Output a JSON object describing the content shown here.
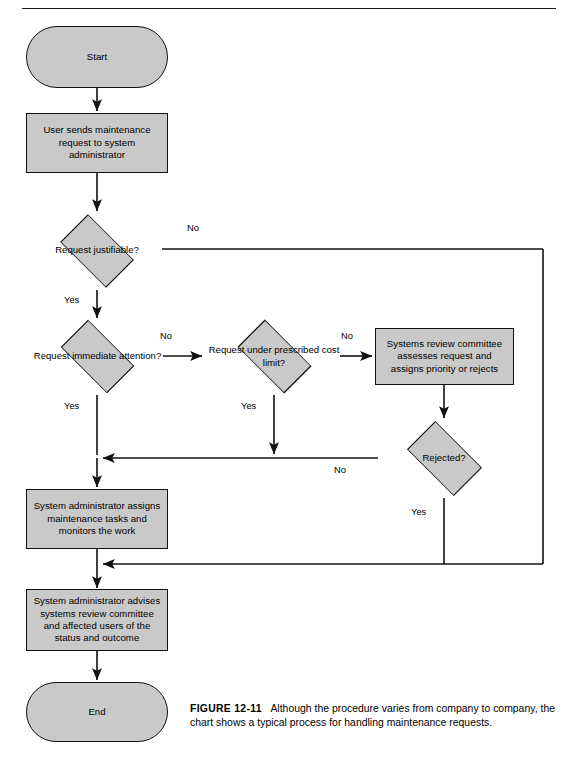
{
  "page": {
    "top_rule": true,
    "background_color": "#ffffff",
    "shape_fill": "#c9c9c9",
    "shape_stroke": "#111111"
  },
  "flowchart": {
    "title": "Maintenance request handling process",
    "nodes": [
      {
        "id": "start",
        "type": "terminator",
        "label": "Start"
      },
      {
        "id": "user_sends",
        "type": "process",
        "label": "User sends maintenance request to system administrator"
      },
      {
        "id": "justifiable",
        "type": "decision",
        "label": "Request justifiable?"
      },
      {
        "id": "immediate",
        "type": "decision",
        "label": "Request immediate attention?"
      },
      {
        "id": "cost_limit",
        "type": "decision",
        "label": "Request under prescribed cost limit?"
      },
      {
        "id": "committee",
        "type": "process",
        "label": "Systems review committee assesses request and assigns priority or rejects"
      },
      {
        "id": "rejected",
        "type": "decision",
        "label": "Rejected?"
      },
      {
        "id": "assigns",
        "type": "process",
        "label": "System administrator assigns maintenance tasks and monitors the work"
      },
      {
        "id": "advises",
        "type": "process",
        "label": "System administrator advises systems review committee and affected users of the status and outcome"
      },
      {
        "id": "end",
        "type": "terminator",
        "label": "End"
      }
    ],
    "edge_labels": {
      "justifiable_no": "No",
      "justifiable_yes": "Yes",
      "immediate_no": "No",
      "immediate_yes": "Yes",
      "cost_no": "No",
      "cost_yes": "Yes",
      "rejected_no": "No",
      "rejected_yes": "Yes"
    }
  },
  "caption": {
    "figure_label": "FIGURE 12-11",
    "text": "Although the procedure varies from company to company, the chart shows a typical process for handling maintenance requests."
  }
}
